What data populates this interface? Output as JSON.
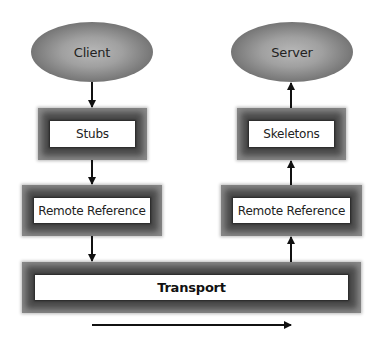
{
  "diagram": {
    "type": "RMI layered architecture",
    "client_side": {
      "top": {
        "label": "Client",
        "shape": "ellipse"
      },
      "layer1": {
        "label": "Stubs",
        "shape": "framed-box"
      },
      "layer2": {
        "label": "Remote Reference",
        "shape": "framed-box"
      }
    },
    "server_side": {
      "top": {
        "label": "Server",
        "shape": "ellipse"
      },
      "layer1": {
        "label": "Skeletons",
        "shape": "framed-box"
      },
      "layer2": {
        "label": "Remote Reference",
        "shape": "framed-box"
      }
    },
    "transport": {
      "label": "Transport",
      "shape": "framed-box"
    },
    "edges": [
      {
        "from": "Client",
        "to": "Stubs",
        "direction": "down"
      },
      {
        "from": "Stubs",
        "to": "Remote Reference (client)",
        "direction": "down"
      },
      {
        "from": "Remote Reference (client)",
        "to": "Transport",
        "direction": "down"
      },
      {
        "from": "Transport",
        "to": "Remote Reference (server)",
        "direction": "up"
      },
      {
        "from": "Remote Reference (server)",
        "to": "Skeletons",
        "direction": "up"
      },
      {
        "from": "Skeletons",
        "to": "Server",
        "direction": "up"
      }
    ],
    "flow_arrow": {
      "direction": "right",
      "meaning": "client-to-server flow"
    }
  }
}
